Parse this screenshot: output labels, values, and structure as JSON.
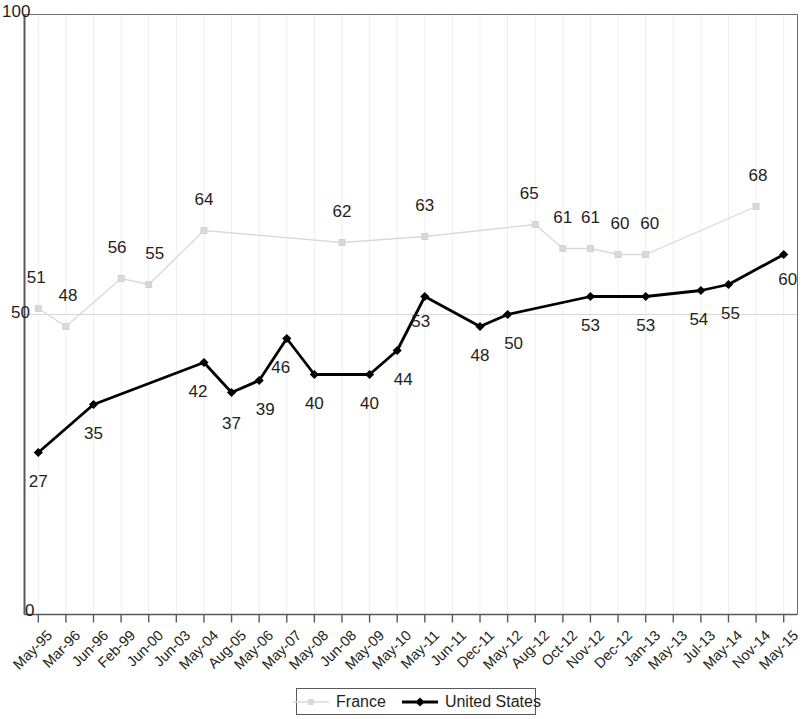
{
  "chart_data": {
    "type": "line",
    "title": "",
    "subtitle": "",
    "xlabel": "",
    "ylabel": "",
    "ylim": [
      0,
      100
    ],
    "yticks": [
      0,
      50,
      100
    ],
    "ytick_labels": [
      "0",
      "50",
      "100"
    ],
    "grid": true,
    "legend_position": "bottom-center",
    "categories": [
      "May-95",
      "Mar-96",
      "Jun-96",
      "Feb-99",
      "Jun-00",
      "Jun-03",
      "May-04",
      "Aug-05",
      "May-06",
      "May-07",
      "May-08",
      "Jun-08",
      "May-09",
      "May-10",
      "May-11",
      "Jun-11",
      "Dec-11",
      "May-12",
      "Aug-12",
      "Oct-12",
      "Nov-12",
      "Dec-12",
      "Jan-13",
      "May-13",
      "Jul-13",
      "May-14",
      "Nov-14",
      "May-15"
    ],
    "series": [
      {
        "name": "France",
        "color": "#d9d9d9",
        "marker": "square",
        "values": [
          51,
          48,
          null,
          56,
          55,
          null,
          64,
          null,
          null,
          null,
          null,
          62,
          null,
          null,
          63,
          null,
          null,
          null,
          65,
          61,
          61,
          60,
          60,
          null,
          null,
          null,
          68,
          null
        ],
        "labels": [
          "51",
          "48",
          "",
          "56",
          "55",
          "",
          "64",
          "",
          "",
          "",
          "",
          "62",
          "",
          "",
          "63",
          "",
          "",
          "",
          "65",
          "61",
          "61",
          "60",
          "60",
          "",
          "",
          "",
          "68",
          ""
        ]
      },
      {
        "name": "United States",
        "color": "#000000",
        "marker": "diamond",
        "values": [
          27,
          null,
          35,
          null,
          null,
          null,
          42,
          37,
          39,
          46,
          40,
          null,
          40,
          44,
          53,
          null,
          48,
          50,
          null,
          null,
          53,
          null,
          53,
          null,
          54,
          55,
          null,
          60
        ],
        "labels": [
          "27",
          "",
          "35",
          "",
          "",
          "",
          "42",
          "37",
          "39",
          "46",
          "40",
          "",
          "40",
          "44",
          "53",
          "",
          "48",
          "50",
          "",
          "",
          "53",
          "",
          "53",
          "",
          "54",
          "55",
          "",
          "60"
        ]
      }
    ]
  },
  "axis": {
    "y_top": "100",
    "y_mid": "50",
    "y_bottom": "0"
  },
  "legend": {
    "items": [
      {
        "label": "France",
        "color": "#d9d9d9"
      },
      {
        "label": "United States",
        "color": "#000000"
      }
    ]
  }
}
